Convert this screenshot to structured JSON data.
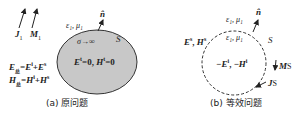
{
  "panel_a": {
    "caption": "(a) 原问题",
    "source_J": "J",
    "source_J_sub": "1",
    "source_M": "M",
    "source_M_sub": "1",
    "medium": "ε₁, μ₁",
    "normal": "n̂",
    "surface": "S",
    "conductor": "σ→∞",
    "interior_E": "E",
    "interior_E_sup": "t",
    "interior_eq1": "=0, ",
    "interior_H": "H",
    "interior_H_sup": "t",
    "interior_eq2": "=0",
    "total_E": "E",
    "total_E_sub": "总",
    "total_E_eq": "=E",
    "total_E_sup1": "i",
    "total_E_plus": "+E",
    "total_E_sup2": "s",
    "total_H": "H",
    "total_H_sub": "总",
    "total_H_eq": "=H",
    "total_H_sup1": "i",
    "total_H_plus": "+H",
    "total_H_sup2": "s",
    "fill_color": "#c8c8c8"
  },
  "panel_b": {
    "caption": "(b) 等效问题",
    "outer_medium": "ε₁, μ₁",
    "inner_medium": "ε₁, μ₁",
    "normal": "n̂",
    "surface": "S",
    "scattered_E": "E",
    "scattered_E_sup": "s",
    "scattered_sep": ", ",
    "scattered_H": "H",
    "scattered_H_sup": "s",
    "inner_E": "−E",
    "inner_E_sup": "i",
    "inner_sep": ", −",
    "inner_H": "H",
    "inner_H_sup": "i",
    "current_M": "M",
    "current_M_sub": "S",
    "current_J": "J",
    "current_J_sub": "S"
  }
}
